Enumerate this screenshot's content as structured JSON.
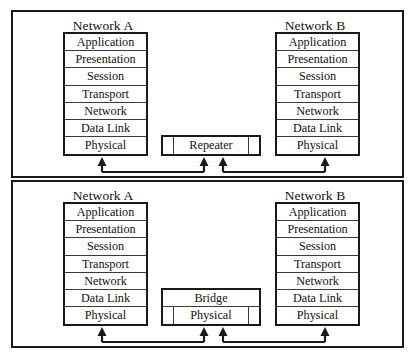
{
  "diagram": {
    "background_color": "#ffffff",
    "line_color": "#1a1a1a"
  },
  "layers": [
    "Application",
    "Presentation",
    "Session",
    "Transport",
    "Network",
    "Data Link",
    "Physical"
  ],
  "panels": [
    {
      "id": "repeater-panel",
      "left_stack": {
        "title": "Network A",
        "layers": [
          "Application",
          "Presentation",
          "Session",
          "Transport",
          "Network",
          "Data Link",
          "Physical"
        ]
      },
      "right_stack": {
        "title": "Network B",
        "layers": [
          "Application",
          "Presentation",
          "Session",
          "Transport",
          "Network",
          "Data Link",
          "Physical"
        ]
      },
      "device": {
        "name": "Repeater",
        "rows": [
          {
            "label": "Repeater",
            "has_ports": true
          }
        ]
      }
    },
    {
      "id": "bridge-panel",
      "left_stack": {
        "title": "Network A",
        "layers": [
          "Application",
          "Presentation",
          "Session",
          "Transport",
          "Network",
          "Data Link",
          "Physical"
        ]
      },
      "right_stack": {
        "title": "Network B",
        "layers": [
          "Application",
          "Presentation",
          "Session",
          "Transport",
          "Network",
          "Data Link",
          "Physical"
        ]
      },
      "device": {
        "name": "Bridge",
        "rows": [
          {
            "label": "Bridge",
            "has_ports": false
          },
          {
            "label": "Physical",
            "has_ports": true
          }
        ]
      }
    }
  ]
}
